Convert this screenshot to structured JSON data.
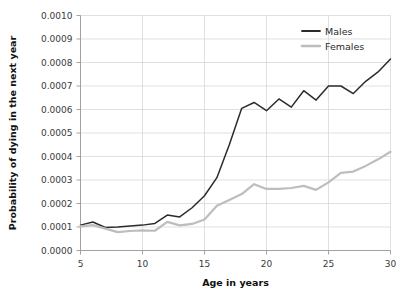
{
  "chart_data": {
    "type": "line",
    "title": "",
    "xlabel": "Age in years",
    "ylabel": "Probability of dying in the next year",
    "xlim": [
      5,
      30
    ],
    "ylim": [
      0.0,
      0.001
    ],
    "grid": true,
    "legend_position": "top-right",
    "x_ticks": [
      5,
      10,
      15,
      20,
      25,
      30
    ],
    "x_tick_labels": [
      "5",
      "10",
      "15",
      "20",
      "25",
      "30"
    ],
    "y_ticks": [
      0.0,
      0.0001,
      0.0002,
      0.0003,
      0.0004,
      0.0005,
      0.0006,
      0.0007,
      0.0008,
      0.0009,
      0.001
    ],
    "y_tick_labels": [
      "0.0000",
      "0.0001",
      "0.0002",
      "0.0003",
      "0.0004",
      "0.0005",
      "0.0006",
      "0.0007",
      "0.0008",
      "0.0009",
      "0.0010"
    ],
    "x": [
      5,
      6,
      7,
      8,
      9,
      10,
      11,
      12,
      13,
      14,
      15,
      16,
      17,
      18,
      19,
      20,
      21,
      22,
      23,
      24,
      25,
      26,
      27,
      28,
      29,
      30
    ],
    "series": [
      {
        "name": "Males",
        "color": "#2b2b2b",
        "values": [
          0.000108,
          0.000121,
          9.8e-05,
          0.0001,
          0.000104,
          0.000108,
          0.000115,
          0.000151,
          0.000143,
          0.000182,
          0.000233,
          0.00031,
          0.00045,
          0.000605,
          0.00063,
          0.000595,
          0.000645,
          0.00061,
          0.00068,
          0.00064,
          0.0007,
          0.0007,
          0.000668,
          0.00072,
          0.00076,
          0.000815
        ]
      },
      {
        "name": "Females",
        "color": "#bdbdbd",
        "values": [
          0.000103,
          0.000108,
          9.3e-05,
          7.8e-05,
          8.3e-05,
          8.6e-05,
          8.4e-05,
          0.000122,
          0.000107,
          0.000113,
          0.000132,
          0.00019,
          0.000215,
          0.00024,
          0.000282,
          0.000262,
          0.000262,
          0.000266,
          0.000275,
          0.000258,
          0.00029,
          0.00033,
          0.000336,
          0.00036,
          0.000388,
          0.00042
        ]
      }
    ]
  },
  "legend": {
    "items": [
      {
        "label": "Males",
        "color": "#2b2b2b"
      },
      {
        "label": "Females",
        "color": "#bdbdbd"
      }
    ]
  }
}
